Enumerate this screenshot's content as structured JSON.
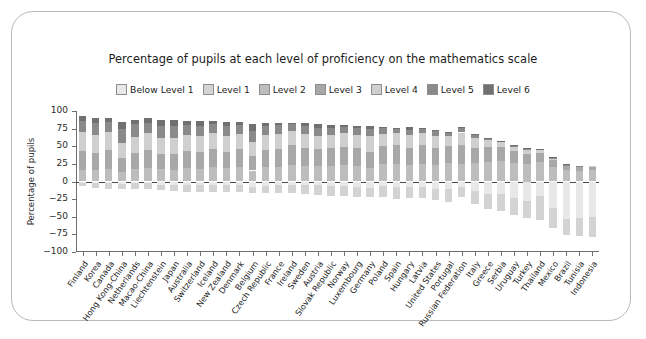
{
  "chart_data": {
    "type": "bar",
    "title": "Percentage of pupils at each level of proficiency on the mathematics scale",
    "xlabel": "",
    "ylabel": "Percentage of pupils",
    "ylim": [
      -100,
      100
    ],
    "yticks": [
      100,
      75,
      50,
      25,
      0,
      -25,
      -50,
      -75,
      -100
    ],
    "ytick_labels": [
      "100",
      "75",
      "50",
      "25",
      "0",
      "−25",
      "−50",
      "−75",
      "−100"
    ],
    "grid": false,
    "legend_position": "top-center",
    "stacked": true,
    "diverging": true,
    "note": "Positive axis stacks Levels 2-6; negative axis stacks Below Level 1 and Level 1.",
    "legend": [
      {
        "name": "Below Level 1",
        "color": "#e8e8e8"
      },
      {
        "name": "Level 1",
        "color": "#d3d3d3"
      },
      {
        "name": "Level 2",
        "color": "#bdbdbd"
      },
      {
        "name": "Level 3",
        "color": "#a8a8a8"
      },
      {
        "name": "Level 4",
        "color": "#cfcfcf"
      },
      {
        "name": "Level 5",
        "color": "#8a8a8a"
      },
      {
        "name": "Level 6",
        "color": "#707070"
      }
    ],
    "categories": [
      "Finland",
      "Korea",
      "Canada",
      "Hong Kong-China",
      "Netherlands",
      "Macao-China",
      "Liechtenstein",
      "Japan",
      "Australia",
      "Switzerland",
      "Iceland",
      "New Zealand",
      "Denmark",
      "Belgium",
      "Czech Republic",
      "France",
      "Ireland",
      "Sweden",
      "Austria",
      "Slovak Republic",
      "Norway",
      "Luxembourg",
      "Germany",
      "Poland",
      "Spain",
      "Hungary",
      "Latvia",
      "United States",
      "Portugal",
      "Russian Federation",
      "Italy",
      "Greece",
      "Serbia",
      "Uruguay",
      "Turkey",
      "Thailand",
      "Mexico",
      "Brazil",
      "Tunisia",
      "Indonesia"
    ],
    "series": [
      {
        "name": "Below Level 1",
        "side": "negative",
        "values": [
          1.5,
          2.5,
          2.4,
          3.9,
          2.6,
          2.3,
          4.6,
          4.7,
          4.3,
          4.9,
          5.5,
          4.5,
          4.7,
          7.5,
          5.7,
          5.6,
          4.7,
          5.6,
          5.6,
          6.7,
          6.9,
          7.4,
          9.2,
          6.8,
          8.1,
          7.8,
          7.6,
          10.2,
          11.3,
          7.1,
          13.2,
          17.8,
          17.5,
          23.6,
          27.7,
          20.2,
          38.1,
          53.3,
          51.1,
          50.5
        ]
      },
      {
        "name": "Level 1",
        "side": "negative",
        "values": [
          5.3,
          7.1,
          7.7,
          6.5,
          8.4,
          8.7,
          7.9,
          8.6,
          10.0,
          9.6,
          9.0,
          10.0,
          10.7,
          9.3,
          10.6,
          11.0,
          11.4,
          11.7,
          13.2,
          13.2,
          13.9,
          14.1,
          12.4,
          15.2,
          16.4,
          15.2,
          16.1,
          15.5,
          18.0,
          14.4,
          18.7,
          21.2,
          24.7,
          24.6,
          24.6,
          34.0,
          27.9,
          21.9,
          26.7,
          27.6
        ]
      },
      {
        "name": "Level 2",
        "side": "positive",
        "values": [
          16.0,
          16.6,
          18.3,
          13.8,
          18.0,
          19.3,
          17.1,
          16.3,
          18.6,
          17.5,
          20.0,
          19.2,
          20.4,
          15.6,
          20.2,
          20.2,
          23.6,
          21.7,
          21.6,
          22.1,
          24.0,
          22.6,
          19.0,
          24.8,
          24.7,
          23.0,
          25.3,
          23.9,
          26.4,
          24.7,
          26.0,
          27.9,
          28.7,
          26.2,
          25.0,
          27.5,
          20.8,
          16.5,
          15.3,
          16.0
        ]
      },
      {
        "name": "Level 3",
        "side": "positive",
        "values": [
          27.7,
          24.2,
          26.2,
          20.0,
          23.0,
          25.4,
          22.0,
          22.4,
          24.0,
          24.3,
          26.1,
          23.0,
          26.2,
          20.7,
          24.3,
          25.7,
          28.0,
          25.5,
          24.0,
          24.9,
          25.2,
          24.7,
          22.6,
          25.3,
          26.7,
          24.3,
          26.4,
          23.8,
          23.7,
          26.4,
          22.2,
          21.2,
          19.9,
          17.2,
          13.9,
          12.6,
          9.5,
          5.3,
          5.0,
          4.4
        ]
      },
      {
        "name": "Level 4",
        "side": "positive",
        "values": [
          26.1,
          25.0,
          25.1,
          20.2,
          22.6,
          23.6,
          23.2,
          23.6,
          23.0,
          22.5,
          22.2,
          21.8,
          21.3,
          20.1,
          20.8,
          22.1,
          20.2,
          19.8,
          18.9,
          18.9,
          19.1,
          18.5,
          22.6,
          17.7,
          17.7,
          18.2,
          17.0,
          16.6,
          14.2,
          18.4,
          13.3,
          9.1,
          7.2,
          6.0,
          5.9,
          4.6,
          3.1,
          1.7,
          1.5,
          1.4
        ]
      },
      {
        "name": "Level 5",
        "side": "positive",
        "values": [
          16.7,
          16.7,
          14.8,
          20.2,
          18.2,
          15.1,
          17.0,
          16.1,
          14.0,
          14.2,
          12.7,
          14.1,
          11.8,
          15.9,
          12.9,
          11.6,
          9.1,
          11.6,
          11.0,
          10.2,
          8.7,
          9.5,
          10.6,
          7.8,
          5.1,
          8.1,
          6.3,
          8.0,
          4.6,
          6.8,
          4.5,
          2.3,
          1.7,
          1.6,
          2.4,
          1.3,
          0.5,
          0.5,
          0.4,
          0.1
        ]
      },
      {
        "name": "Level 6",
        "side": "positive",
        "values": [
          6.7,
          8.1,
          6.2,
          10.5,
          5.4,
          6.0,
          7.6,
          8.2,
          5.9,
          7.5,
          4.5,
          5.7,
          4.3,
          9.3,
          5.0,
          3.5,
          2.2,
          3.9,
          5.5,
          3.9,
          2.6,
          3.1,
          4.3,
          2.3,
          1.4,
          3.3,
          1.2,
          1.3,
          0.8,
          1.6,
          1.2,
          0.6,
          0.3,
          0.3,
          0.3,
          0.2,
          0.2,
          0.2,
          0.1,
          0.1
        ]
      }
    ]
  }
}
